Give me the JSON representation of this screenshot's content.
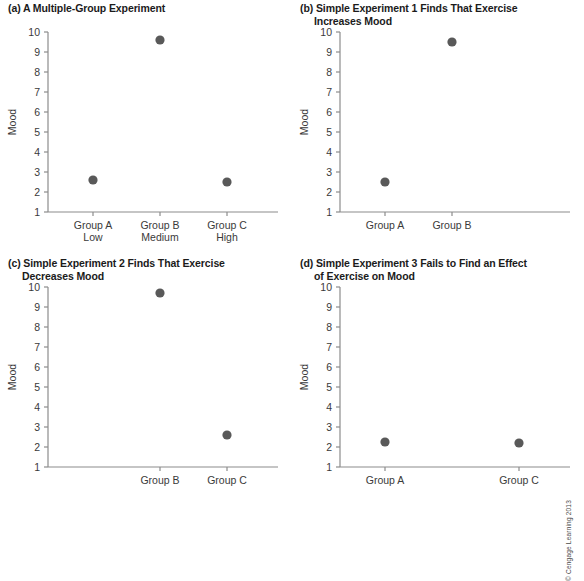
{
  "figure": {
    "copyright": "© Cengage Learning 2013",
    "dot_color": "#595959",
    "axis_color": "#8c8c8c",
    "text_color": "#3a3a3a"
  },
  "chart_data": [
    {
      "id": "a",
      "type": "scatter",
      "title_line1": "(a) A Multiple-Group Experiment",
      "title_line2": "",
      "ylabel": "Mood",
      "xlabel": "",
      "ylim": [
        1,
        10
      ],
      "yticks": [
        10,
        9,
        8,
        7,
        6,
        5,
        4,
        3,
        2,
        1
      ],
      "ytick_labels": [
        "10",
        "9",
        "8",
        "7",
        "6",
        "5",
        "4",
        "3",
        "2",
        "1"
      ],
      "grid": false,
      "legend": "none",
      "categories": [
        "Group A",
        "Group B",
        "Group C"
      ],
      "category_sublabels": [
        "Low",
        "Medium",
        "High"
      ],
      "values": [
        2.6,
        9.6,
        2.5
      ]
    },
    {
      "id": "b",
      "type": "scatter",
      "title_line1": "(b) Simple Experiment 1 Finds That Exercise",
      "title_line2": "Increases Mood",
      "ylabel": "Mood",
      "xlabel": "",
      "ylim": [
        1,
        10
      ],
      "yticks": [
        10,
        9,
        8,
        7,
        6,
        5,
        4,
        3,
        2,
        1
      ],
      "ytick_labels": [
        "10",
        "9",
        "8",
        "7",
        "6",
        "5",
        "4",
        "3",
        "2",
        "1"
      ],
      "grid": false,
      "legend": "none",
      "categories": [
        "Group A",
        "Group B"
      ],
      "category_sublabels": [
        "",
        ""
      ],
      "values": [
        2.5,
        9.5
      ]
    },
    {
      "id": "c",
      "type": "scatter",
      "title_line1": "(c) Simple Experiment 2 Finds That Exercise",
      "title_line2": "Decreases Mood",
      "ylabel": "Mood",
      "xlabel": "",
      "ylim": [
        1,
        10
      ],
      "yticks": [
        10,
        9,
        8,
        7,
        6,
        5,
        4,
        3,
        2,
        1
      ],
      "ytick_labels": [
        "10",
        "9",
        "8",
        "7",
        "6",
        "5",
        "4",
        "3",
        "2",
        "1"
      ],
      "grid": false,
      "legend": "none",
      "categories": [
        "Group B",
        "Group C"
      ],
      "category_sublabels": [
        "",
        ""
      ],
      "values": [
        9.7,
        2.6
      ]
    },
    {
      "id": "d",
      "type": "scatter",
      "title_line1": "(d) Simple Experiment 3 Fails to Find an Effect",
      "title_line2": "of Exercise on Mood",
      "ylabel": "Mood",
      "xlabel": "",
      "ylim": [
        1,
        10
      ],
      "yticks": [
        10,
        9,
        8,
        7,
        6,
        5,
        4,
        3,
        2,
        1
      ],
      "ytick_labels": [
        "10",
        "9",
        "8",
        "7",
        "6",
        "5",
        "4",
        "3",
        "2",
        "1"
      ],
      "grid": false,
      "legend": "none",
      "categories": [
        "Group A",
        "Group C"
      ],
      "category_sublabels": [
        "",
        ""
      ],
      "values": [
        2.25,
        2.2
      ]
    }
  ]
}
